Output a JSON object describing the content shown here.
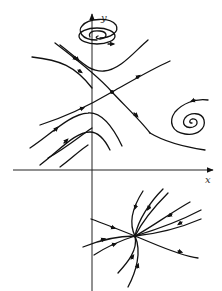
{
  "figure": {
    "type": "phase-portrait",
    "axes": {
      "x_label": "x",
      "y_label": "y"
    },
    "equilibria": [
      {
        "kind": "saddle",
        "position": "upper-center"
      },
      {
        "kind": "center-spiral",
        "position": "top, on y-axis"
      },
      {
        "kind": "spiral",
        "position": "right"
      },
      {
        "kind": "node",
        "position": "lower-right, below x-axis"
      }
    ],
    "colors": {
      "stroke": "#111111",
      "background": "#ffffff"
    }
  }
}
